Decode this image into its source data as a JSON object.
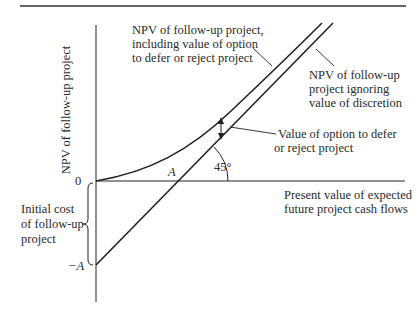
{
  "diagram": {
    "type": "option-value-diagram",
    "y_axis_label": "NPV of follow-up project",
    "x_axis_label": [
      "Present value of expected",
      "future project cash flows"
    ],
    "origin_label": "0",
    "intercept_label": "−A",
    "x_intercept_label": "A",
    "angle_label": "45°",
    "brace_label": [
      "Initial cost",
      "of follow-up",
      "project"
    ],
    "curve_label": [
      "NPV of follow-up project,",
      "including value of option",
      "to defer or reject project"
    ],
    "line_label": [
      "NPV of follow-up",
      "project ignoring",
      "value of discretion"
    ],
    "gap_label": [
      "Value of option to defer",
      "or reject project"
    ],
    "colors": {
      "ink": "#222222",
      "text": "#2a2a2a",
      "background": "#ffffff"
    }
  }
}
